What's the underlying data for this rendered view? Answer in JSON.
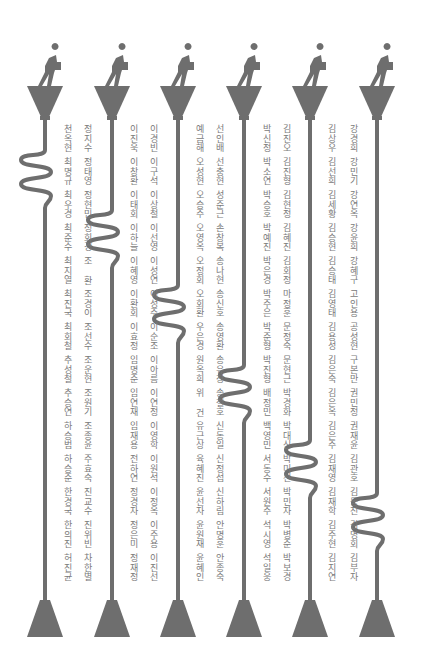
{
  "art": {
    "colors": {
      "pole": "#6e6e6e",
      "text": "#7a7a7a",
      "background": "#ffffff"
    },
    "poles": [
      {
        "x": 45,
        "coil_y": 150
      },
      {
        "x": 112,
        "coil_y": 210
      },
      {
        "x": 178,
        "coil_y": 285
      },
      {
        "x": 244,
        "coil_y": 365
      },
      {
        "x": 310,
        "coil_y": 440
      },
      {
        "x": 377,
        "coil_y": 493
      }
    ],
    "figure_icon": "walking-person-carrying-box-icon"
  },
  "name_columns": [
    {
      "x": 353,
      "names": [
        "강경희",
        "강민기",
        "강연옥",
        "강윤희",
        "강혜구",
        "고인용",
        "공성현",
        "구본만",
        "권민정",
        "권재윤",
        "김관호",
        "김동진",
        "김명회",
        "김부자"
      ]
    },
    {
      "x": 331,
      "names": [
        "김상우",
        "김선희",
        "김세황",
        "김승현",
        "김승태",
        "김영태",
        "김용성",
        "김은숙",
        "김은옥",
        "김은주",
        "김재영",
        "김재학",
        "김주현",
        "김지연"
      ]
    },
    {
      "x": 286,
      "names": [
        "김진오",
        "김진형",
        "김현정",
        "김혜진",
        "김회정",
        "마정훈",
        "문정숙",
        "문현근",
        "박경화",
        "박대신",
        "박미선",
        "박민자",
        "박병준",
        "박보경"
      ]
    },
    {
      "x": 266,
      "names": [
        "박신정",
        "박소연",
        "박승호",
        "박예진",
        "박은경",
        "박주은",
        "박준형",
        "박진형",
        "배정민",
        "백영민",
        "서동수",
        "서원주",
        "석시영",
        "석일웅"
      ]
    },
    {
      "x": 219,
      "names": [
        "선인배",
        "선충현",
        "성준근",
        "손창복",
        "송나현",
        "송신호",
        "송영환",
        "송유창",
        "송철호",
        "신동일",
        "신정섭",
        "신하림",
        "안명훈",
        "안종숙"
      ]
    },
    {
      "x": 199,
      "names": [
        "예금해",
        "오성현",
        "오승주",
        "오영옥",
        "오정회",
        "오회환",
        "우은경",
        "원옥희",
        "위 건",
        "유근상",
        "육혜진",
        "윤선자",
        "윤원재",
        "윤혜인"
      ]
    },
    {
      "x": 153,
      "names": [
        "이경빈",
        "이구석",
        "이상철",
        "이선영",
        "이성연",
        "이성주",
        "이순조",
        "이아름",
        "이연정",
        "이영학",
        "이원석",
        "이정옥",
        "이주용",
        "이진선"
      ]
    },
    {
      "x": 133,
      "names": [
        "이진욱",
        "이창환",
        "이태회",
        "이하늘",
        "이혜영",
        "이환회",
        "이효정",
        "임명준",
        "임연재",
        "임재용",
        "전하연",
        "정경자",
        "정은미",
        "정재정"
      ]
    },
    {
      "x": 87,
      "names": [
        "정지수",
        "정태영",
        "정현민",
        "정회경",
        "조 환",
        "조경이",
        "조선수",
        "조운현",
        "조원기",
        "조종윤",
        "주효숙",
        "진교수",
        "진위빈",
        "차한별"
      ]
    },
    {
      "x": 67,
      "names": [
        "천옥현",
        "최명규",
        "최우경",
        "최준수",
        "최지열",
        "최진국",
        "최회철",
        "추성철",
        "추승연",
        "하승범",
        "하승준",
        "한경국",
        "한의진",
        "허진균"
      ]
    }
  ]
}
